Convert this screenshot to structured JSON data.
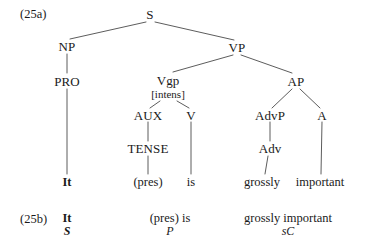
{
  "figure": {
    "example_a_label": "(25a)",
    "example_b_label": "(25b)"
  },
  "tree": {
    "nodes": [
      {
        "id": "S",
        "label": "S",
        "x": 150,
        "y": 14
      },
      {
        "id": "NP",
        "label": "NP",
        "x": 67,
        "y": 46
      },
      {
        "id": "VP",
        "label": "VP",
        "x": 237,
        "y": 47
      },
      {
        "id": "PRO",
        "label": "PRO",
        "x": 67,
        "y": 81
      },
      {
        "id": "Vgp",
        "label": "Vgp",
        "x": 168,
        "y": 80
      },
      {
        "id": "AP",
        "label": "AP",
        "x": 296,
        "y": 81
      },
      {
        "id": "AUX",
        "label": "AUX",
        "x": 148,
        "y": 115
      },
      {
        "id": "V",
        "label": "V",
        "x": 191,
        "y": 115
      },
      {
        "id": "AdvP",
        "label": "AdvP",
        "x": 270,
        "y": 115
      },
      {
        "id": "A",
        "label": "A",
        "x": 322,
        "y": 115
      },
      {
        "id": "TENSE",
        "label": "TENSE",
        "x": 148,
        "y": 148
      },
      {
        "id": "Adv",
        "label": "Adv",
        "x": 270,
        "y": 148
      }
    ],
    "features": [
      {
        "id": "Vgp-feature",
        "label": "[intens]",
        "x": 168,
        "y": 94
      }
    ],
    "terminals": [
      {
        "id": "it",
        "label": "It",
        "x": 67,
        "y": 182,
        "bold": true
      },
      {
        "id": "pres",
        "label": "(pres)",
        "x": 148,
        "y": 182,
        "bold": false
      },
      {
        "id": "is",
        "label": "is",
        "x": 191,
        "y": 182,
        "bold": false
      },
      {
        "id": "grossly",
        "label": "grossly",
        "x": 262,
        "y": 182,
        "bold": false
      },
      {
        "id": "important",
        "label": "important",
        "x": 320,
        "y": 182,
        "bold": false
      }
    ]
  },
  "gloss": {
    "items": [
      {
        "id": "subject",
        "words": "It",
        "function": "S",
        "x": 67,
        "bold": true
      },
      {
        "id": "predicator",
        "words": "(pres)  is",
        "function": "P",
        "x": 170,
        "bold": false
      },
      {
        "id": "subject-complement",
        "words": "grossly important",
        "function": "sC",
        "x": 288,
        "bold": false
      }
    ]
  },
  "colors": {
    "background": "#ffffff",
    "ink": "#1a1a1a",
    "branch": "#4a4a4a"
  }
}
